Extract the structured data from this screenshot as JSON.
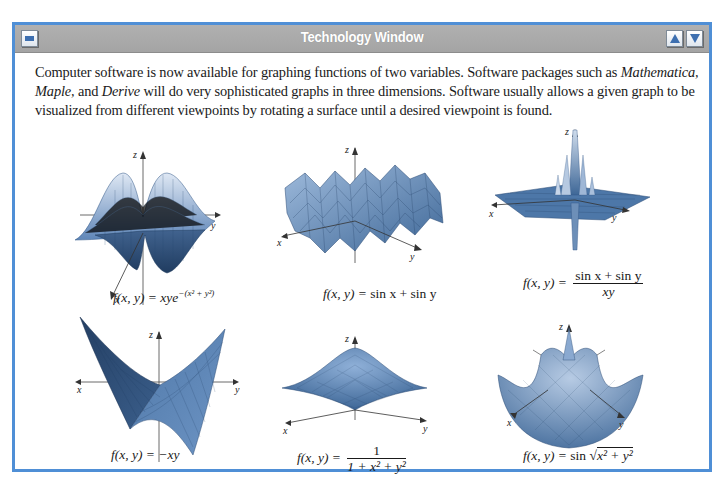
{
  "window": {
    "title": "Technology Window",
    "icons": {
      "minimize": "minimize-icon",
      "scroll_up": "triangle-up-icon",
      "scroll_down": "triangle-down-icon"
    },
    "colors": {
      "border": "#4f8fd6",
      "titlebar": "#a9a9a9",
      "surface": "#6d96c6"
    }
  },
  "intro": {
    "part1": "Computer software is now available for graphing functions of two variables. Software packages such as ",
    "software1": "Mathematica, Maple,",
    "part2": " and ",
    "software2": "Derive",
    "part3": " will do very sophisticated graphs in three dimensions. Software usually allows a given graph to be visualized from different viewpoints by rotating a surface until a desired viewpoint is found."
  },
  "axes": {
    "x": "x",
    "y": "y",
    "z": "z"
  },
  "graphs": [
    {
      "lhs": "f(x, y) = ",
      "rhs": "xye",
      "exp": "−(x² + y²)"
    },
    {
      "lhs": "f(x, y) = ",
      "rhs": "sin x + sin y"
    },
    {
      "lhs": "f(x, y) = ",
      "num": "sin x + sin y",
      "den": "xy"
    },
    {
      "lhs": "f(x, y) = ",
      "rhs": "−xy"
    },
    {
      "lhs": "f(x, y) = ",
      "num": "1",
      "den": "1 + x² + y²"
    },
    {
      "lhs": "f(x, y) = ",
      "rhs": "sin ",
      "radicand": "x² + y²"
    }
  ]
}
